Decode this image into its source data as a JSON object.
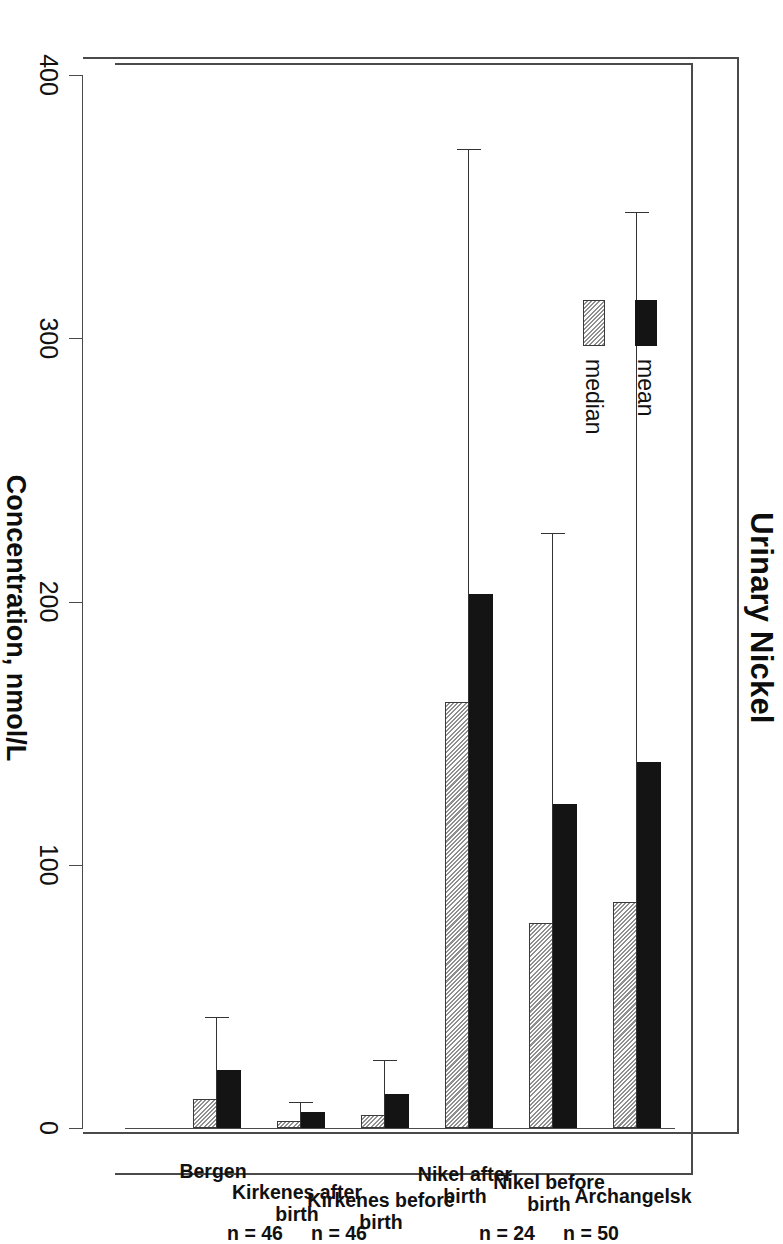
{
  "chart_data": {
    "type": "bar",
    "title": "Urinary Nickel",
    "xlabel": "",
    "ylabel": "Concentration, nmol/L",
    "ylim": [
      0,
      400
    ],
    "yticks": [
      0,
      100,
      200,
      300,
      400
    ],
    "grid": false,
    "legend_position": "upper-left-inside",
    "orientation": "vertical-bars-page-rotated-90",
    "categories": [
      "Archangelsk",
      "Nikel before\nbirth",
      "Nikel after\nbirth",
      "Kirkenes before\nbirth",
      "Kirkenes after\nbirth",
      "Bergen"
    ],
    "sample_sizes": [
      "n = 50",
      "n = 24",
      "",
      "n = 46",
      "n = 46",
      ""
    ],
    "series": [
      {
        "name": "mean",
        "values": [
          139,
          123,
          203,
          13,
          6,
          22
        ]
      },
      {
        "name": "median",
        "values": [
          86,
          78,
          162,
          5,
          2.5,
          11
        ]
      }
    ],
    "error_bars": {
      "applies_to": "mean",
      "upper": [
        348,
        226,
        372,
        26,
        10,
        42
      ]
    }
  },
  "legend": {
    "items": [
      {
        "label": "mean",
        "swatch": "solid-black-swatch"
      },
      {
        "label": "median",
        "swatch": "hatched-gray-swatch"
      }
    ]
  },
  "axis": {
    "tick_labels": [
      "0",
      "100",
      "200",
      "300",
      "400"
    ],
    "title": "Concentration, nmol/L"
  },
  "groups": [
    {
      "label": "Archangelsk",
      "n": "n = 50",
      "mean": 139,
      "median": 86,
      "error_upper": 348
    },
    {
      "label": "Nikel before\nbirth",
      "n": "n = 24",
      "mean": 123,
      "median": 78,
      "error_upper": 226
    },
    {
      "label": "Nikel after\nbirth",
      "n": "",
      "mean": 203,
      "median": 162,
      "error_upper": 372
    },
    {
      "label": "Kirkenes before\nbirth",
      "n": "n = 46",
      "mean": 13,
      "median": 5,
      "error_upper": 26
    },
    {
      "label": "Kirkenes after\nbirth",
      "n": "n = 46",
      "mean": 6,
      "median": 2.5,
      "error_upper": 10
    },
    {
      "label": "Bergen",
      "n": "",
      "mean": 22,
      "median": 11,
      "error_upper": 42
    }
  ],
  "title": {
    "text": "Urinary Nickel"
  },
  "colors": {
    "mean": "#141414",
    "median": "#cfcfcf",
    "axis": "#4a4a4a",
    "text": "#111111",
    "background": "#ffffff"
  }
}
